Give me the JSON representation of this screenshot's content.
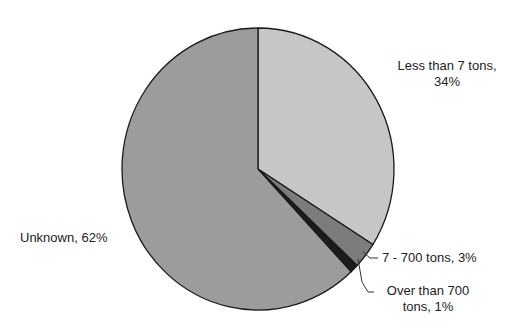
{
  "chart_data": {
    "type": "pie",
    "title": "",
    "start_angle_deg": 0,
    "direction": "clockwise",
    "slices": [
      {
        "label": "Less than 7 tons",
        "value": 34,
        "display": "Less than 7 tons, 34%",
        "color": "#c6c6c6"
      },
      {
        "label": "7 - 700 tons",
        "value": 3,
        "display": "7 - 700 tons, 3%",
        "color": "#7c7c7c"
      },
      {
        "label": "Over than 700 tons",
        "value": 1,
        "display": "Over than 700 tons, 1%",
        "color": "#1c1c1c"
      },
      {
        "label": "Unknown",
        "value": 62,
        "display": "Unknown, 62%",
        "color": "#9c9c9c"
      }
    ],
    "legend": null
  },
  "labels": {
    "less_than_7_line1": "Less than 7 tons,",
    "less_than_7_line2": "34%",
    "mid_range": "7 - 700 tons, 3%",
    "over_700_line1": "Over than 700",
    "over_700_line2": "tons, 1%",
    "unknown": "Unknown, 62%"
  }
}
